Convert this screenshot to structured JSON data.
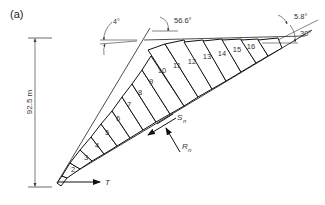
{
  "panel_label": "(a)",
  "height_dimension": "92.5 m",
  "angles": {
    "face_dip": "56.6°",
    "top_tilt": "4°",
    "base_plane": "5.8°",
    "base_dip": "30°"
  },
  "forces": {
    "shear": "S",
    "shear_sub": "n",
    "normal": "R",
    "normal_sub": "n",
    "toe_force": "T"
  },
  "slices": [
    "1",
    "2",
    "3",
    "4",
    "5",
    "6",
    "7",
    "8",
    "9",
    "10",
    "11",
    "12",
    "13",
    "14",
    "15",
    "16"
  ],
  "colors": {
    "line": "#1a1a1a",
    "text": "#333333",
    "thin": "#555555"
  }
}
